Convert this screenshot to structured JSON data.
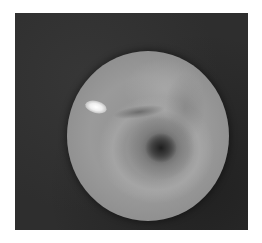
{
  "image": {
    "description": "Grayscale endoscopic view showing circular lumen with dark central opening and specular highlight",
    "colors": {
      "background": "#ffffff",
      "frame": "#2e2e2e",
      "tissue": "#9a9a9a",
      "lumen": "#1e1e1e",
      "highlight": "#ffffff"
    }
  }
}
